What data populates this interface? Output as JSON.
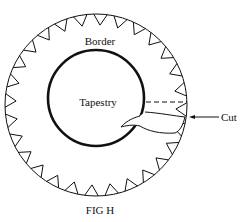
{
  "diagram": {
    "caption": "FIG H",
    "labels": {
      "border": "Border",
      "tapestry": "Tapestry",
      "cut": "Cut"
    },
    "teeth_count": 28,
    "colors": {
      "stroke": "#111111",
      "background": "#ffffff"
    }
  }
}
